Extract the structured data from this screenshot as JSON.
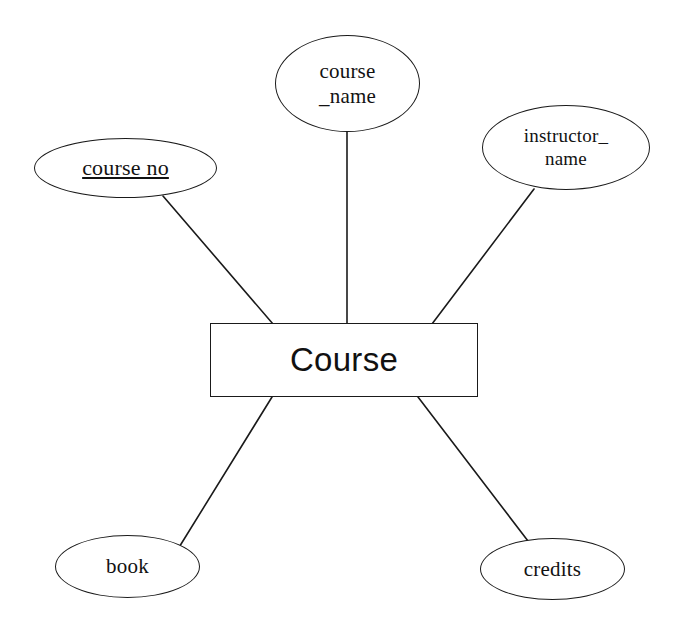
{
  "diagram": {
    "kind": "er-diagram",
    "entity": {
      "name": "Course",
      "shape": "rectangle",
      "box": {
        "x": 210,
        "y": 323,
        "width": 268,
        "height": 74
      }
    },
    "attributes": [
      {
        "id": "course-no",
        "label": "course  no",
        "is_key": true,
        "lines": 1,
        "font_size": 22,
        "ellipse": {
          "x": 34,
          "y": 138,
          "width": 183,
          "height": 60
        }
      },
      {
        "id": "course-name",
        "label": "course\n_name",
        "is_key": false,
        "lines": 2,
        "font_size": 21,
        "ellipse": {
          "x": 275,
          "y": 35,
          "width": 145,
          "height": 97
        }
      },
      {
        "id": "instructor-name",
        "label": "instructor_\nname",
        "is_key": false,
        "lines": 2,
        "font_size": 19,
        "ellipse": {
          "x": 482,
          "y": 105,
          "width": 168,
          "height": 85
        }
      },
      {
        "id": "book",
        "label": "book",
        "is_key": false,
        "lines": 1,
        "font_size": 21,
        "ellipse": {
          "x": 55,
          "y": 535,
          "width": 145,
          "height": 63
        }
      },
      {
        "id": "credits",
        "label": "credits",
        "is_key": false,
        "lines": 1,
        "font_size": 21,
        "ellipse": {
          "x": 480,
          "y": 538,
          "width": 145,
          "height": 62
        }
      }
    ],
    "connectors": [
      {
        "id": "edge-course-no",
        "from": "course-no",
        "to": "Course",
        "x1": 163,
        "y1": 196,
        "x2": 273,
        "y2": 324
      },
      {
        "id": "edge-course-name",
        "from": "course-name",
        "to": "Course",
        "x1": 347,
        "y1": 131,
        "x2": 347,
        "y2": 323
      },
      {
        "id": "edge-instructor-name",
        "from": "instructor-name",
        "to": "Course",
        "x1": 534,
        "y1": 189,
        "x2": 432,
        "y2": 324
      },
      {
        "id": "edge-book",
        "from": "Course",
        "to": "book",
        "x1": 272,
        "y1": 397,
        "x2": 178,
        "y2": 549
      },
      {
        "id": "edge-credits",
        "from": "Course",
        "to": "credits",
        "x1": 418,
        "y1": 397,
        "x2": 528,
        "y2": 541
      }
    ],
    "style": {
      "stroke": "#1a1a1a",
      "background": "#ffffff",
      "text_color": "#121212",
      "stroke_width": 1.6
    }
  }
}
